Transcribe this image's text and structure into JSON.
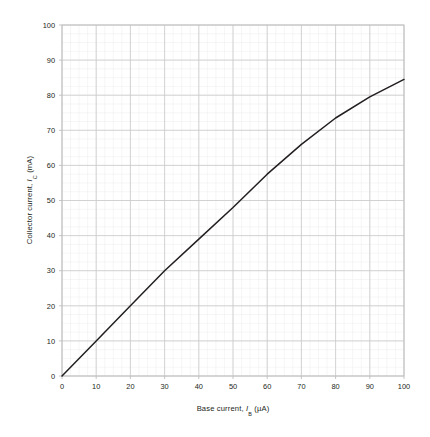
{
  "chart_data": {
    "type": "line",
    "title": "",
    "xlabel": "Base current, I_B (µA)",
    "xlabel_parts": {
      "prefix": "Base current, ",
      "symbol": "I",
      "sub": "B",
      "suffix": " (µA)"
    },
    "ylabel": "Collector current, I_C (mA)",
    "ylabel_parts": {
      "prefix": "Collector current, ",
      "symbol": "I",
      "sub": "C",
      "suffix": " (mA)"
    },
    "xlim": [
      0,
      100
    ],
    "ylim": [
      0,
      100
    ],
    "xticks": [
      0,
      10,
      20,
      30,
      40,
      50,
      60,
      70,
      80,
      90,
      100
    ],
    "yticks": [
      0,
      10,
      20,
      30,
      40,
      50,
      60,
      70,
      80,
      90,
      100
    ],
    "xtick_labels": [
      "0",
      "10",
      "20",
      "30",
      "40",
      "50",
      "60",
      "70",
      "80",
      "90",
      "100"
    ],
    "ytick_labels": [
      "0",
      "10",
      "20",
      "30",
      "40",
      "50",
      "60",
      "70",
      "80",
      "90",
      "100"
    ],
    "x_minor_step": 2.5,
    "y_minor_step": 2.5,
    "grid": true,
    "grid_major_color": "#c9c9c9",
    "grid_minor_color": "#ececec",
    "legend": "none",
    "line_color": "#231f20",
    "line_width": 1.5,
    "x": [
      0,
      10,
      20,
      30,
      40,
      50,
      60,
      70,
      80,
      90,
      100
    ],
    "values": [
      0,
      10,
      20,
      30,
      39,
      48,
      57.5,
      66,
      73.5,
      79.5,
      84.5
    ],
    "series": [
      {
        "name": "Collector current",
        "x": [
          0,
          10,
          20,
          30,
          40,
          50,
          60,
          70,
          80,
          90,
          100
        ],
        "values": [
          0,
          10,
          20,
          30,
          39,
          48,
          57.5,
          66,
          73.5,
          79.5,
          84.5
        ]
      }
    ]
  },
  "plot": {
    "background_color": "#ffffff",
    "frame_color": "#bfbfbf"
  }
}
